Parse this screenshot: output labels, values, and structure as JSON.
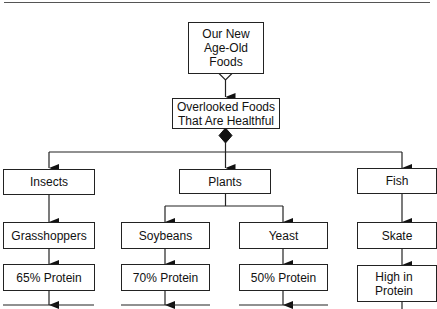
{
  "diagram": {
    "root": {
      "label": "Our New Age-Old Foods"
    },
    "level1": {
      "label": "Overlooked Foods That Are Healthful"
    },
    "categories": [
      {
        "label": "Insects",
        "items": [
          {
            "name": "Grasshoppers",
            "detail": "65% Protein"
          }
        ]
      },
      {
        "label": "Plants",
        "items": [
          {
            "name": "Soybeans",
            "detail": "70% Protein"
          },
          {
            "name": "Yeast",
            "detail": "50% Protein"
          }
        ]
      },
      {
        "label": "Fish",
        "items": [
          {
            "name": "Skate",
            "detail": "High in Protein"
          }
        ]
      }
    ]
  },
  "colors": {
    "line": "#222222",
    "background": "#ffffff"
  }
}
